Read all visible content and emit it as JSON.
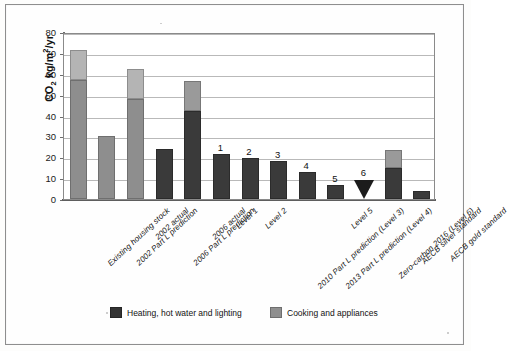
{
  "chart_data": {
    "type": "bar",
    "title": "",
    "subtitle": "",
    "xlabel": "",
    "ylabel": "CO2 kg/m2/yr",
    "ylabel_parts": {
      "prefix": "CO",
      "sub": "2",
      "mid": " kg/m",
      "sup": "2",
      "suffix": "/yr"
    },
    "ylim": [
      0,
      80
    ],
    "yticks": [
      0,
      10,
      20,
      30,
      40,
      50,
      60,
      70,
      80
    ],
    "grid": true,
    "stacked": true,
    "legend_position": "bottom",
    "categories": [
      "Existing housing stock",
      "2002 Part L prediction",
      "2002 actual",
      "2006 Part L prediction",
      "2006 actual",
      "Level 1",
      "Level 2",
      "2010 Part L prediction (Level 3)",
      "2013 Part L prediction (Level 4)",
      "Level 5",
      "Zero-carbon 2016 (Level 6)",
      "AECB silver standard",
      "AECB gold standard"
    ],
    "series": [
      {
        "name": "Heating, hot water and lighting",
        "color": "#3a3a3a",
        "values": [
          57,
          30,
          48,
          24,
          42,
          21.5,
          19.5,
          18,
          13,
          6.5,
          0,
          15,
          4
        ]
      },
      {
        "name": "Cooking and appliances",
        "color": "#9a9a9a",
        "values": [
          14.5,
          0,
          14.5,
          0,
          14.5,
          0,
          0,
          0,
          0,
          0,
          0,
          8.5,
          0
        ]
      }
    ],
    "totals": [
      71.5,
      30,
      62.5,
      24,
      56.5,
      21.5,
      19.5,
      18,
      13,
      6.5,
      0,
      23.5,
      4
    ],
    "bar_annotations": [
      {
        "category": "Level 1",
        "label": "1"
      },
      {
        "category": "Level 2",
        "label": "2"
      },
      {
        "category": "2010 Part L prediction (Level 3)",
        "label": "3"
      },
      {
        "category": "2013 Part L prediction (Level 4)",
        "label": "4"
      },
      {
        "category": "Level 5",
        "label": "5"
      },
      {
        "category": "Zero-carbon 2016 (Level 6)",
        "label": "6"
      }
    ],
    "markers": [
      {
        "category": "Zero-carbon 2016 (Level 6)",
        "shape": "triangle-down",
        "value": 0,
        "color": "#1c1c1c"
      }
    ]
  },
  "legend": {
    "items": [
      {
        "label": "Heating, hot water and lighting",
        "swatch": "dark"
      },
      {
        "label": "Cooking and appliances",
        "swatch": "gray"
      }
    ]
  },
  "axis": {
    "tick_labels": [
      "80",
      "70",
      "60",
      "50",
      "40",
      "30",
      "20",
      "10",
      "0"
    ]
  }
}
